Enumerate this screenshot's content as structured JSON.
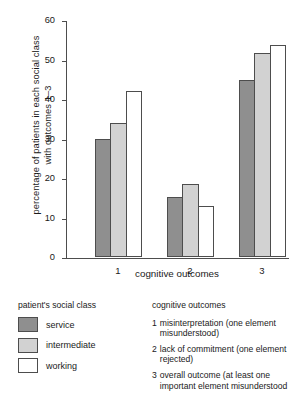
{
  "chart_data": {
    "type": "bar",
    "title": "",
    "xlabel": "cognitive outcomes",
    "ylabel_line1": "percentage of patients in each social class",
    "ylabel_line2": "with outcomes 1–3",
    "categories": [
      "1",
      "2",
      "3"
    ],
    "yticks": [
      0,
      10,
      20,
      30,
      40,
      50,
      60
    ],
    "ylim": [
      0,
      60
    ],
    "grid": false,
    "legend_position": "below-left",
    "series": [
      {
        "name": "service",
        "color": "#8f8f8f",
        "values": [
          30.0,
          15.3,
          44.8
        ]
      },
      {
        "name": "intermediate",
        "color": "#d2d2d2",
        "values": [
          33.9,
          18.4,
          51.6
        ]
      },
      {
        "name": "working",
        "color": "#ffffff",
        "values": [
          42.0,
          12.9,
          53.7
        ]
      }
    ]
  },
  "legend_class": {
    "title": "patient's social class",
    "items": [
      {
        "label": "service"
      },
      {
        "label": "intermediate"
      },
      {
        "label": "working"
      }
    ]
  },
  "legend_outcomes": {
    "title": "cognitive outcomes",
    "items": [
      {
        "num": "1",
        "text": "misinterpretation (one element misunderstood)"
      },
      {
        "num": "2",
        "text": "lack of commitment (one element rejected)"
      },
      {
        "num": "3",
        "text": "overall outcome (at least one important element misunderstood"
      }
    ]
  }
}
